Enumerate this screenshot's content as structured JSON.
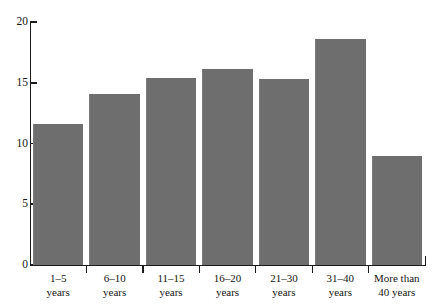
{
  "chart_data": {
    "type": "bar",
    "title": "",
    "subtitle": "",
    "xlabel": "",
    "ylabel": "",
    "categories": [
      "1–5\nyears",
      "6–10\nyears",
      "11–15\nyears",
      "16–20\nyears",
      "21–30\nyears",
      "31–40\nyears",
      "More than\n40 years"
    ],
    "values": [
      11.6,
      14.1,
      15.4,
      16.1,
      15.3,
      18.6,
      9.0
    ],
    "ylim": [
      0,
      20
    ],
    "yticks": [
      0,
      5,
      10,
      15,
      20
    ],
    "ytick_labels": [
      "0",
      "5",
      "10",
      "15",
      "20"
    ],
    "grid": false,
    "legend": null,
    "bar_color": "#6e6e6e",
    "axis_color": "#1b1b1b",
    "background_color": "#ffffff",
    "annotations": []
  }
}
